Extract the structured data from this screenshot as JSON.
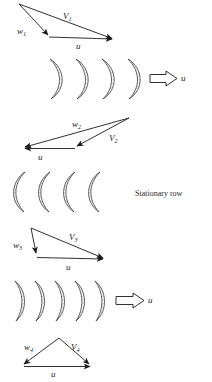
{
  "figure": {
    "title": "",
    "background_color": "#ffffff",
    "line_color": "#1b1b1b",
    "hatch_color": "#555555",
    "annotations": {
      "stationary_row_label": "Stationary row"
    },
    "velocity_triangles": [
      {
        "id": "triangle-1",
        "labels": {
          "relative": "w",
          "relative_sub": "1",
          "absolute": "V",
          "absolute_sub": "1",
          "blade_speed": "u"
        },
        "apex": "top-left",
        "flow_direction": "right"
      },
      {
        "id": "triangle-2",
        "labels": {
          "relative": "w",
          "relative_sub": "2",
          "absolute": "V",
          "absolute_sub": "2",
          "blade_speed": "u"
        },
        "apex": "top-right",
        "flow_direction": "left"
      },
      {
        "id": "triangle-3",
        "labels": {
          "relative": "w",
          "relative_sub": "3",
          "absolute": "V",
          "absolute_sub": "3",
          "blade_speed": "u"
        },
        "apex": "top-left",
        "flow_direction": "right"
      },
      {
        "id": "triangle-4",
        "labels": {
          "relative": "w",
          "relative_sub": "4",
          "absolute": "V",
          "absolute_sub": "4",
          "blade_speed": "u"
        },
        "apex": "top-center",
        "flow_direction": "right"
      }
    ],
    "blade_rows": [
      {
        "id": "moving-row-1",
        "type": "moving",
        "blade_count": 4,
        "orientation": "convex-right",
        "motion_arrow_label": "u"
      },
      {
        "id": "stationary-row",
        "type": "stationary",
        "blade_count": 4,
        "orientation": "convex-left",
        "motion_arrow_label": ""
      },
      {
        "id": "moving-row-2",
        "type": "moving",
        "blade_count": 5,
        "orientation": "convex-right",
        "motion_arrow_label": "u"
      }
    ]
  }
}
